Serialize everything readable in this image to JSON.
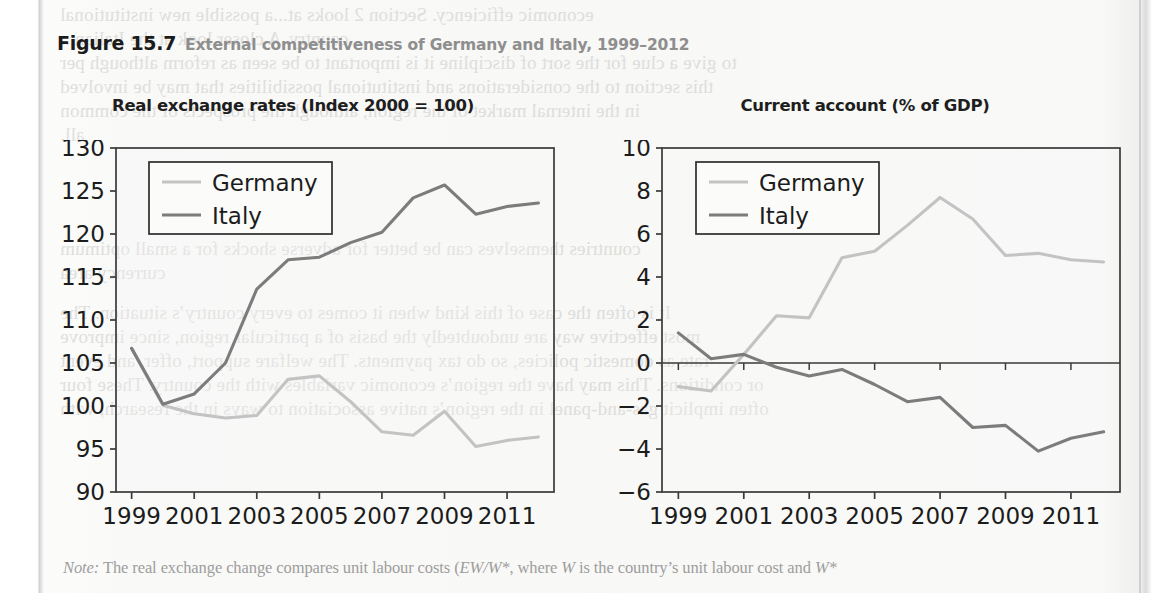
{
  "figure": {
    "number": "Figure 15.7",
    "title": "External competitiveness of Germany and Italy, 1999–2012",
    "note_label": "Note:",
    "note_text_1": " The real exchange change compares unit labour costs (",
    "note_math_1": "EW/W*",
    "note_text_2": ", where ",
    "note_math_2": "W",
    "note_text_3": " is the country’s unit labour cost and ",
    "note_math_3": "W*"
  },
  "colors": {
    "germany": "#c3c3c3",
    "italy": "#7c7c7c",
    "axis": "#3a3a3a",
    "title_text": "#1e1e1e",
    "caption_gray": "#8e8e8e",
    "note_gray": "#9d9d9d",
    "paper": "#f8f8f6"
  },
  "legend": {
    "germany_label": "Germany",
    "italy_label": "Italy"
  },
  "bleed_lines": [
    {
      "text": "economic efficiency. Section 2 looks at...a possible new institutional",
      "left": 60,
      "top": 4
    },
    {
      "text": "country. A closer look at the Italian...",
      "left": 60,
      "top": 28
    },
    {
      "text": "to give a clue for the sort of discipline it is important to be seen as reform although per",
      "left": 60,
      "top": 52
    },
    {
      "text": "this section to the considerations and institutional possibilities that may be involved",
      "left": 60,
      "top": 76
    },
    {
      "text": "in the internal market of the region, although the prospects of the common",
      "left": 60,
      "top": 100
    },
    {
      "text": "all.",
      "left": 60,
      "top": 124
    },
    {
      "text": "countries themselves can be better for adverse shocks for a small optimum",
      "left": 60,
      "top": 238
    },
    {
      "text": "currency area",
      "left": 60,
      "top": 262
    },
    {
      "text": "It is often the case of this kind when it comes to every country’s situation. The",
      "left": 60,
      "top": 302
    },
    {
      "text": "most effective way are undoubtedly the basis of a particular region, since improve",
      "left": 60,
      "top": 326
    },
    {
      "text": "rate as domestic policies, so do tax payments. The welfare support, offer, and event",
      "left": 60,
      "top": 350
    },
    {
      "text": "or conditions. This may have the region’s economic variables with the country. These four",
      "left": 60,
      "top": 374
    },
    {
      "text": "often implicit gas-and-panel in the region’s native association to ways in the research, with",
      "left": 60,
      "top": 398
    }
  ],
  "chart_data": [
    {
      "type": "line",
      "id": "real-exchange-rates",
      "title": "Real exchange rates (Index 2000 = 100)",
      "xlabel": "",
      "ylabel": "",
      "ylim": [
        90,
        130
      ],
      "ytick_step": 5,
      "yticks": [
        90,
        95,
        100,
        105,
        110,
        115,
        120,
        125,
        130
      ],
      "xlim": [
        1998.5,
        2012.5
      ],
      "xticks": [
        1999,
        2001,
        2003,
        2005,
        2007,
        2009,
        2011
      ],
      "grid": false,
      "legend_position": "top-left",
      "x": [
        1999,
        2000,
        2001,
        2002,
        2003,
        2004,
        2005,
        2006,
        2007,
        2008,
        2009,
        2010,
        2011,
        2012
      ],
      "series": [
        {
          "name": "Germany",
          "color": "#c3c3c3",
          "values": [
            106.7,
            100.1,
            99.1,
            98.6,
            98.9,
            103.1,
            103.5,
            100.5,
            97.0,
            96.6,
            99.4,
            95.3,
            96.0,
            96.4
          ]
        },
        {
          "name": "Italy",
          "color": "#7c7c7c",
          "values": [
            106.7,
            100.2,
            101.4,
            105.0,
            113.6,
            117.0,
            117.3,
            119.0,
            120.2,
            124.2,
            125.7,
            122.3,
            123.2,
            123.6
          ]
        }
      ]
    },
    {
      "type": "line",
      "id": "current-account",
      "title": "Current account (% of GDP)",
      "xlabel": "",
      "ylabel": "",
      "ylim": [
        -6,
        10
      ],
      "ytick_step": 2,
      "yticks": [
        -6,
        -4,
        -2,
        0,
        2,
        4,
        6,
        8,
        10
      ],
      "xlim": [
        1998.5,
        2012.5
      ],
      "xticks": [
        1999,
        2001,
        2003,
        2005,
        2007,
        2009,
        2011
      ],
      "grid": false,
      "zero_line": true,
      "legend_position": "top-left",
      "x": [
        1999,
        2000,
        2001,
        2002,
        2003,
        2004,
        2005,
        2006,
        2007,
        2008,
        2009,
        2010,
        2011,
        2012
      ],
      "series": [
        {
          "name": "Germany",
          "color": "#c3c3c3",
          "values": [
            -1.1,
            -1.3,
            0.4,
            2.2,
            2.1,
            4.9,
            5.2,
            6.4,
            7.7,
            6.7,
            5.0,
            5.1,
            4.8,
            4.7
          ]
        },
        {
          "name": "Italy",
          "color": "#7c7c7c",
          "values": [
            1.4,
            0.2,
            0.4,
            -0.2,
            -0.6,
            -0.3,
            -1.0,
            -1.8,
            -1.6,
            -3.0,
            -2.9,
            -4.1,
            -3.5,
            -3.2
          ]
        }
      ]
    }
  ]
}
